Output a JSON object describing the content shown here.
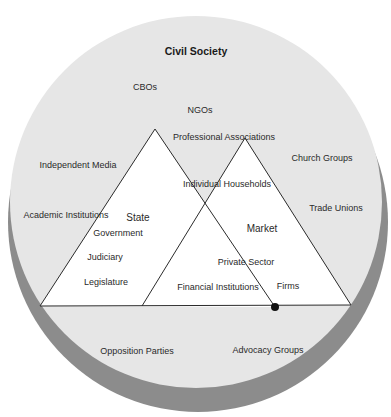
{
  "diagram": {
    "title": "Civil Society",
    "colors": {
      "background": "#ffffff",
      "circle_fill": "#e6e6e6",
      "circle_shadow": "#8c8c8c",
      "triangle_fill": "#ffffff",
      "line": "#2b2b2b",
      "node": "#111111"
    },
    "triangles": {
      "state": {
        "label": "State"
      },
      "market": {
        "label": "Market"
      }
    },
    "labels": {
      "civil_society": "Civil Society",
      "cbos": "CBOs",
      "ngos": "NGOs",
      "professional_associations": "Professional Associations",
      "independent_media": "Independent Media",
      "church_groups": "Church Groups",
      "individual_households": "Individual Households",
      "academic_institutions": "Academic Institutions",
      "trade_unions": "Trade Unions",
      "state": "State",
      "government": "Government",
      "market": "Market",
      "judiciary": "Judiciary",
      "private_sector": "Private Sector",
      "legislature": "Legislature",
      "financial_institutions": "Financial Institutions",
      "firms": "Firms",
      "opposition_parties": "Opposition Parties",
      "advocacy_groups": "Advocacy Groups"
    }
  }
}
